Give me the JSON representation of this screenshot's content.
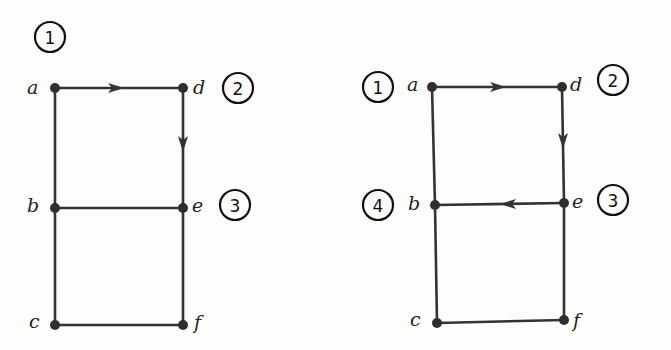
{
  "graphs": [
    {
      "id": "left",
      "vertices": [
        {
          "name": "a",
          "x": 55,
          "y": 88
        },
        {
          "name": "d",
          "x": 183,
          "y": 88
        },
        {
          "name": "b",
          "x": 55,
          "y": 208
        },
        {
          "name": "e",
          "x": 183,
          "y": 208
        },
        {
          "name": "c",
          "x": 55,
          "y": 325
        },
        {
          "name": "f",
          "x": 183,
          "y": 325
        }
      ],
      "edges": [
        {
          "from": "a",
          "to": "d",
          "directed": true
        },
        {
          "from": "d",
          "to": "e",
          "directed": true
        },
        {
          "from": "a",
          "to": "b",
          "directed": false
        },
        {
          "from": "b",
          "to": "c",
          "directed": false
        },
        {
          "from": "b",
          "to": "e",
          "directed": false
        },
        {
          "from": "e",
          "to": "f",
          "directed": false
        },
        {
          "from": "c",
          "to": "f",
          "directed": false
        }
      ],
      "order_markers": [
        {
          "label": "1",
          "x": 50,
          "y": 37
        },
        {
          "label": "2",
          "x": 238,
          "y": 88
        },
        {
          "label": "3",
          "x": 235,
          "y": 205
        }
      ]
    },
    {
      "id": "right",
      "vertices": [
        {
          "name": "a",
          "x": 432,
          "y": 87
        },
        {
          "name": "d",
          "x": 562,
          "y": 87
        },
        {
          "name": "b",
          "x": 435,
          "y": 205
        },
        {
          "name": "e",
          "x": 564,
          "y": 203
        },
        {
          "name": "c",
          "x": 437,
          "y": 323
        },
        {
          "name": "f",
          "x": 564,
          "y": 320
        }
      ],
      "edges": [
        {
          "from": "a",
          "to": "d",
          "directed": true
        },
        {
          "from": "d",
          "to": "e",
          "directed": true
        },
        {
          "from": "e",
          "to": "b",
          "directed": true
        },
        {
          "from": "a",
          "to": "b",
          "directed": false
        },
        {
          "from": "b",
          "to": "c",
          "directed": false
        },
        {
          "from": "e",
          "to": "f",
          "directed": false
        },
        {
          "from": "c",
          "to": "f",
          "directed": false
        }
      ],
      "order_markers": [
        {
          "label": "1",
          "x": 378,
          "y": 87
        },
        {
          "label": "2",
          "x": 613,
          "y": 80
        },
        {
          "label": "3",
          "x": 613,
          "y": 200
        },
        {
          "label": "4",
          "x": 378,
          "y": 205
        }
      ]
    }
  ]
}
